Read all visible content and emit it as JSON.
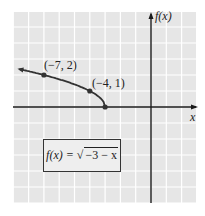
{
  "chart_data": {
    "type": "line",
    "title": "",
    "function_label": "f(x) = √(−3 − x)",
    "formula": {
      "lhs": "f(x) =",
      "radicand": "−3 − x"
    },
    "xlabel": "x",
    "ylabel": "f(x)",
    "grid": true,
    "xlim": [
      -9,
      3
    ],
    "ylim": [
      -6,
      6
    ],
    "labeled_points": [
      {
        "x": -7,
        "y": 2,
        "label": "(−7, 2)"
      },
      {
        "x": -4,
        "y": 1,
        "label": "(−4, 1)"
      },
      {
        "x": -3,
        "y": 0,
        "label": ""
      }
    ],
    "series": [
      {
        "name": "f(x) = sqrt(-3 - x)",
        "x": [
          -9,
          -8,
          -7,
          -6,
          -5,
          -4,
          -3.5,
          -3
        ],
        "y": [
          2.449,
          2.236,
          2,
          1.732,
          1.414,
          1,
          0.707,
          0
        ],
        "arrow_left": true,
        "endpoint": {
          "x": -3,
          "y": 0
        }
      }
    ],
    "colors": {
      "grid_bg": "#e6e6e6",
      "grid_line": "#ffffff",
      "curve": "#333333",
      "axis": "#1a1a1a"
    }
  }
}
